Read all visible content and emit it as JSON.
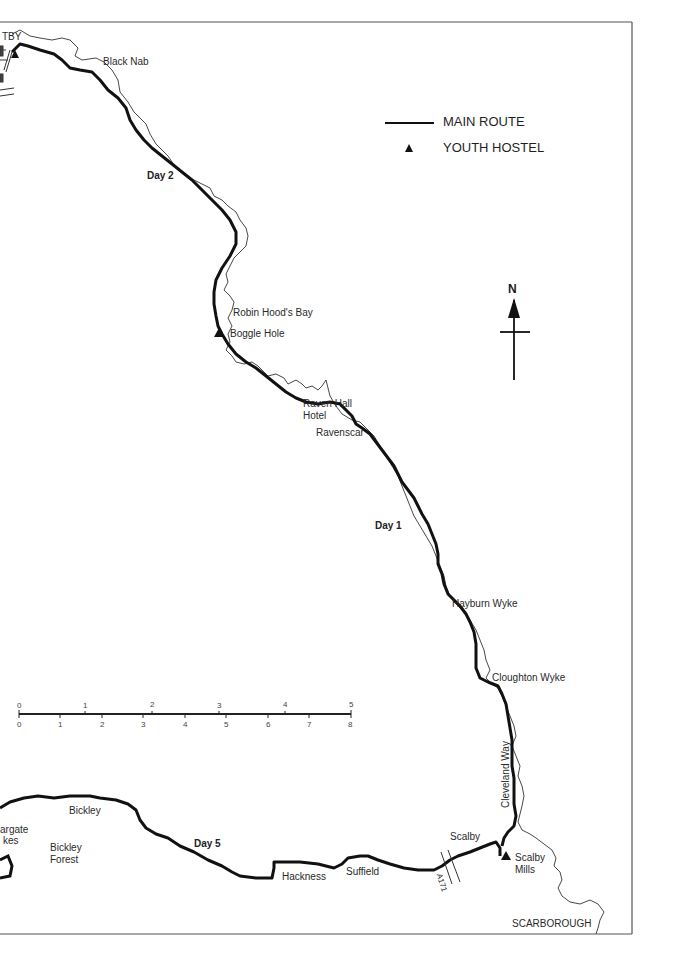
{
  "map": {
    "legend": {
      "main_route": "MAIN ROUTE",
      "youth_hostel": "YOUTH HOSTEL"
    },
    "north_label": "N",
    "places": {
      "whitby_partial": "TBY",
      "black_nab": "Black Nab",
      "robin_hoods_bay": "Robin Hood's Bay",
      "boggle_hole": "Boggle Hole",
      "raven_hall_1": "Raven Hall",
      "raven_hall_2": "Hotel",
      "ravenscar": "Ravenscar",
      "hayburn_wyke": "Hayburn Wyke",
      "cloughton_wyke": "Cloughton Wyke",
      "cleveland_way": "Cleveland Way",
      "scalby": "Scalby",
      "scalby_mills_1": "Scalby",
      "scalby_mills_2": "Mills",
      "scarborough": "SCARBOROUGH",
      "suffield": "Suffield",
      "hackness": "Hackness",
      "bickley": "Bickley",
      "bickley_forest_1": "Bickley",
      "bickley_forest_2": "Forest",
      "langdale_partial_1": "argate",
      "langdale_partial_2": "kes",
      "road_a171": "A171"
    },
    "day_labels": {
      "day1": "Day 1",
      "day2": "Day 2",
      "day5": "Day 5"
    },
    "scale": {
      "miles": [
        "0",
        "1",
        "2",
        "3",
        "4",
        "5"
      ],
      "km": [
        "0",
        "1",
        "2",
        "3",
        "4",
        "5",
        "6",
        "7",
        "8"
      ]
    },
    "colors": {
      "route": "#111111",
      "coast": "#333333",
      "frame": "#555555"
    }
  }
}
